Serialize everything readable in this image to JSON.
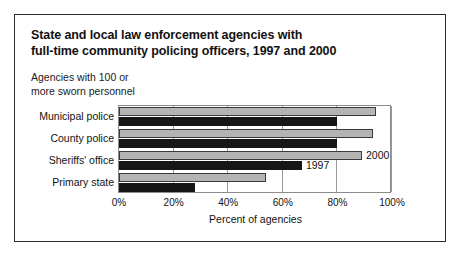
{
  "figure": {
    "title_line1": "State and local law enforcement agencies with",
    "title_line2": "full-time community policing officers, 1997 and 2000",
    "subtitle_line1": "Agencies with 100 or",
    "subtitle_line2": "more sworn personnel"
  },
  "chart_data": {
    "type": "bar",
    "orientation": "horizontal",
    "title": "State and local law enforcement agencies with full-time community policing officers, 1997 and 2000",
    "subtitle": "Agencies with 100 or more sworn personnel",
    "xlabel": "Percent of agencies",
    "ylabel": "",
    "xlim": [
      0,
      100
    ],
    "xticks": [
      0,
      20,
      40,
      60,
      80,
      100
    ],
    "xticklabels": [
      "0%",
      "20%",
      "40%",
      "60%",
      "80%",
      "100%"
    ],
    "grid": true,
    "legend_position": "inline-annotation",
    "categories": [
      "Municipal police",
      "County police",
      "Sheriffs' office",
      "Primary state"
    ],
    "series": [
      {
        "name": "2000",
        "color": "#b4b4b4",
        "values": [
          94,
          93,
          89,
          54
        ]
      },
      {
        "name": "1997",
        "color": "#161616",
        "values": [
          80,
          80,
          67,
          28
        ]
      }
    ],
    "annotations": [
      {
        "text": "2000",
        "series": "2000",
        "category": "Sheriffs' office"
      },
      {
        "text": "1997",
        "series": "1997",
        "category": "Sheriffs' office"
      }
    ]
  }
}
